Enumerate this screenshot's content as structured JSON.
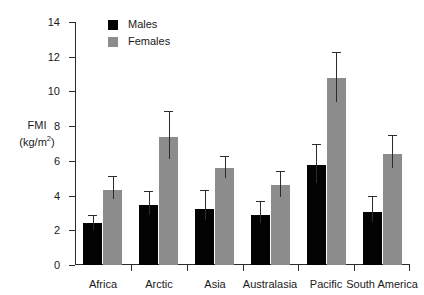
{
  "chart_data": {
    "type": "bar",
    "title": "",
    "subtitle": "",
    "xlabel": "",
    "ylabel": "FMI (kg/m2)",
    "ylabel_main": "FMI",
    "ylabel_unit": "(kg/m",
    "ylabel_unit_sup": "2",
    "ylabel_unit_close": ")",
    "categories": [
      "Africa",
      "Arctic",
      "Asia",
      "Australasia",
      "Pacific",
      "South America"
    ],
    "series": [
      {
        "name": "Males",
        "color": "#030303",
        "values": [
          2.4,
          3.45,
          3.2,
          2.9,
          5.75,
          3.05
        ],
        "err_low": [
          2.0,
          2.9,
          2.6,
          2.4,
          4.7,
          2.5
        ],
        "err_high": [
          2.9,
          4.25,
          4.3,
          3.7,
          7.0,
          4.0
        ]
      },
      {
        "name": "Females",
        "color": "#8c8c8c",
        "values": [
          4.35,
          7.4,
          5.6,
          4.6,
          10.8,
          6.4
        ],
        "err_low": [
          3.8,
          6.1,
          5.0,
          3.9,
          9.4,
          5.6
        ],
        "err_high": [
          5.1,
          8.85,
          6.3,
          5.4,
          12.25,
          7.5
        ]
      }
    ],
    "ylim": [
      0,
      14
    ],
    "yticks": [
      0,
      2,
      4,
      6,
      8,
      10,
      12,
      14
    ],
    "ytick_labels": [
      "0",
      "2",
      "4",
      "6",
      "8",
      "10",
      "12",
      "14"
    ],
    "grid": false,
    "legend_position": "top-left-inside",
    "legend": [
      "Males",
      "Females"
    ],
    "error_bar_style": "upper-and-lower-whisker"
  }
}
